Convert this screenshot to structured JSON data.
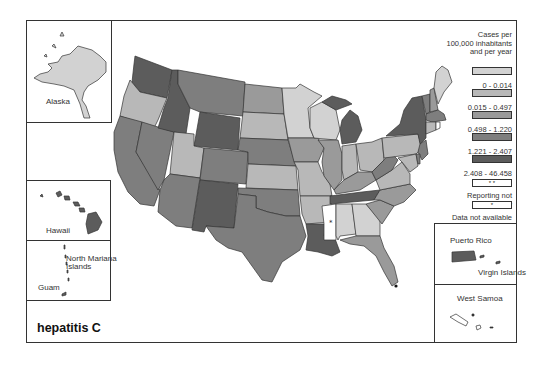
{
  "map": {
    "title": "hepatitis C",
    "colors": {
      "c0": "#d2d2d2",
      "c1": "#b8b8b8",
      "c2": "#9a9a9a",
      "c3": "#7e7e7e",
      "c4": "#5c5c5c",
      "na": "#ffffff",
      "border": "#333333"
    }
  },
  "insets": {
    "alaska": "Alaska",
    "hawaii": "Hawaii",
    "north_mariana": "North Mariana",
    "north_mariana_2": "Islands",
    "guam": "Guam",
    "puerto_rico": "Puerto Rico",
    "virgin_islands": "Virgin Islands",
    "west_samoa": "West Samoa"
  },
  "legend": {
    "heading": [
      "Cases per",
      "100,000 inhabitants",
      "and per year"
    ],
    "items": [
      {
        "label": "0 - 0.014",
        "color": "#d2d2d2",
        "symbol": ""
      },
      {
        "label": "0.015 - 0.497",
        "color": "#b8b8b8",
        "symbol": ""
      },
      {
        "label": "0.498 - 1.220",
        "color": "#9a9a9a",
        "symbol": ""
      },
      {
        "label": "1.221 - 2.407",
        "color": "#7e7e7e",
        "symbol": ""
      },
      {
        "label": "2.408 - 46.458",
        "color": "#5c5c5c",
        "symbol": ""
      },
      {
        "label": "Reporting not mandatory",
        "color": "#ffffff",
        "symbol": "* *"
      },
      {
        "label": "Data not available",
        "color": "#ffffff",
        "symbol": "*"
      }
    ]
  },
  "states": {
    "WA": "c4",
    "OR": "c1",
    "CA": "c3",
    "NV": "c3",
    "ID": "c4",
    "MT": "c3",
    "WY": "c4",
    "UT": "c1",
    "AZ": "c3",
    "CO": "c3",
    "NM": "c4",
    "ND": "c2",
    "SD": "c1",
    "NE": "c3",
    "KS": "c1",
    "OK": "c3",
    "TX": "c3",
    "MN": "c0",
    "IA": "c2",
    "MO": "c1",
    "AR": "c1",
    "LA": "c4",
    "WI": "c0",
    "IL": "c2",
    "MI": "c4",
    "IN": "c1",
    "OH": "c1",
    "KY": "c2",
    "TN": "c4",
    "MS": "na",
    "AL": "c0",
    "GA": "c0",
    "FL": "c2",
    "SC": "c2",
    "NC": "c2",
    "VA": "c1",
    "WV": "c3",
    "PA": "c1",
    "NY": "c4",
    "VT": "c3",
    "NH": "c2",
    "ME": "c0",
    "MA": "c3",
    "CT": "c1",
    "NJ": "c3",
    "MD": "c1",
    "DE": "c3",
    "AK": "c0",
    "HI": "c4",
    "PR": "c4"
  }
}
